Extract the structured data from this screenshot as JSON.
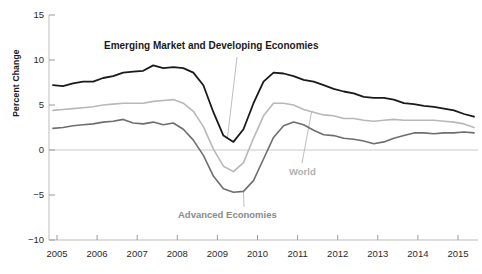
{
  "chart_data": {
    "type": "line",
    "title": "",
    "xlabel": "",
    "ylabel": "Percent Change",
    "ylim": [
      -10,
      15
    ],
    "xlim": [
      2004.75,
      2015.5
    ],
    "grid": false,
    "zero_line": true,
    "legend_position": "inline-annotations",
    "ytick_labels": [
      "15",
      "10",
      "5",
      "0",
      "−5",
      "−10"
    ],
    "ytick_values": [
      15,
      10,
      5,
      0,
      -5,
      -10
    ],
    "xtick_labels": [
      "2005",
      "2006",
      "2007",
      "2008",
      "2009",
      "2010",
      "2011",
      "2012",
      "2013",
      "2014",
      "2015"
    ],
    "xtick_values": [
      2005,
      2006,
      2007,
      2008,
      2009,
      2010,
      2011,
      2012,
      2013,
      2014,
      2015
    ],
    "annotations": [
      {
        "text": "Emerging Market and Developing Economies",
        "series": "Emerging Market and Developing Economies",
        "color": "#1a1a1a"
      },
      {
        "text": "World",
        "series": "World",
        "color": "#b0b0b0"
      },
      {
        "text": "Advanced Economies",
        "series": "Advanced Economies",
        "color": "#8a8a8a"
      }
    ],
    "series": [
      {
        "name": "Emerging Market and Developing Economies",
        "color": "#1a1a1a",
        "width": 1.8,
        "x": [
          2004.9,
          2005.15,
          2005.4,
          2005.65,
          2005.9,
          2006.15,
          2006.4,
          2006.65,
          2006.9,
          2007.15,
          2007.4,
          2007.65,
          2007.9,
          2008.15,
          2008.4,
          2008.65,
          2008.9,
          2009.15,
          2009.4,
          2009.65,
          2009.9,
          2010.15,
          2010.4,
          2010.65,
          2010.9,
          2011.15,
          2011.4,
          2011.65,
          2011.9,
          2012.15,
          2012.4,
          2012.65,
          2012.9,
          2013.15,
          2013.4,
          2013.65,
          2013.9,
          2014.15,
          2014.4,
          2014.65,
          2014.9,
          2015.15,
          2015.4
        ],
        "values": [
          7.2,
          7.1,
          7.4,
          7.6,
          7.6,
          8.0,
          8.2,
          8.6,
          8.7,
          8.8,
          9.4,
          9.1,
          9.2,
          9.1,
          8.6,
          7.2,
          4.2,
          1.6,
          0.9,
          2.3,
          5.2,
          7.6,
          8.6,
          8.5,
          8.2,
          7.8,
          7.6,
          7.2,
          6.8,
          6.5,
          6.3,
          5.9,
          5.8,
          5.8,
          5.6,
          5.2,
          5.1,
          4.9,
          4.8,
          4.6,
          4.4,
          4.0,
          3.7
        ]
      },
      {
        "name": "World",
        "color": "#b8b8b8",
        "width": 1.6,
        "x": [
          2004.9,
          2005.15,
          2005.4,
          2005.65,
          2005.9,
          2006.15,
          2006.4,
          2006.65,
          2006.9,
          2007.15,
          2007.4,
          2007.65,
          2007.9,
          2008.15,
          2008.4,
          2008.65,
          2008.9,
          2009.15,
          2009.4,
          2009.65,
          2009.9,
          2010.15,
          2010.4,
          2010.65,
          2010.9,
          2011.15,
          2011.4,
          2011.65,
          2011.9,
          2012.15,
          2012.4,
          2012.65,
          2012.9,
          2013.15,
          2013.4,
          2013.65,
          2013.9,
          2014.15,
          2014.4,
          2014.65,
          2014.9,
          2015.15,
          2015.4
        ],
        "values": [
          4.4,
          4.5,
          4.6,
          4.7,
          4.8,
          5.0,
          5.1,
          5.2,
          5.2,
          5.2,
          5.4,
          5.5,
          5.6,
          5.2,
          4.3,
          2.6,
          0.1,
          -1.8,
          -2.4,
          -1.4,
          1.3,
          3.8,
          5.2,
          5.2,
          5.0,
          4.5,
          4.2,
          3.9,
          3.8,
          3.5,
          3.5,
          3.3,
          3.2,
          3.3,
          3.4,
          3.3,
          3.3,
          3.3,
          3.3,
          3.2,
          3.1,
          2.9,
          2.5
        ]
      },
      {
        "name": "Advanced Economies",
        "color": "#6e6e6e",
        "width": 1.6,
        "x": [
          2004.9,
          2005.15,
          2005.4,
          2005.65,
          2005.9,
          2006.15,
          2006.4,
          2006.65,
          2006.9,
          2007.15,
          2007.4,
          2007.65,
          2007.9,
          2008.15,
          2008.4,
          2008.65,
          2008.9,
          2009.15,
          2009.4,
          2009.65,
          2009.9,
          2010.15,
          2010.4,
          2010.65,
          2010.9,
          2011.15,
          2011.4,
          2011.65,
          2011.9,
          2012.15,
          2012.4,
          2012.65,
          2012.9,
          2013.15,
          2013.4,
          2013.65,
          2013.9,
          2014.15,
          2014.4,
          2014.65,
          2014.9,
          2015.15,
          2015.4
        ],
        "values": [
          2.4,
          2.5,
          2.7,
          2.8,
          2.9,
          3.1,
          3.2,
          3.4,
          3.0,
          2.9,
          3.1,
          2.8,
          3.0,
          2.3,
          1.1,
          -0.6,
          -2.9,
          -4.3,
          -4.7,
          -4.6,
          -3.4,
          -1.0,
          1.4,
          2.7,
          3.1,
          2.8,
          2.2,
          1.7,
          1.6,
          1.3,
          1.2,
          1.0,
          0.7,
          0.9,
          1.3,
          1.6,
          1.9,
          1.9,
          1.8,
          1.9,
          1.9,
          2.0,
          1.9
        ]
      }
    ]
  },
  "axis": {
    "y_title": "Percent Change"
  }
}
